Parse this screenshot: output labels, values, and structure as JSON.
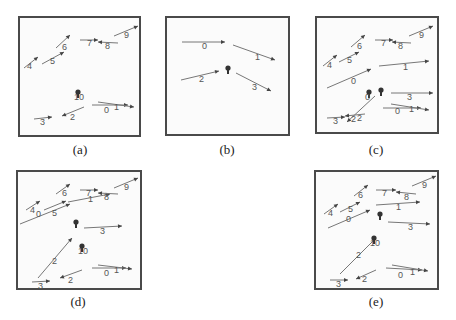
{
  "colors": {
    "border": "#4a4a4a",
    "arrow": "#777777",
    "arrowhead": "#444444",
    "label": "#555555",
    "marker": "#333333"
  },
  "panels": [
    {
      "id": "a",
      "caption": "(a)",
      "box": [
        18,
        16,
        123,
        121
      ],
      "caption_pos": [
        60,
        142
      ],
      "arrows": [
        {
          "label": "4",
          "x1": 4,
          "y1": 50,
          "x2": 18,
          "y2": 39,
          "lx": 7,
          "ly": 51
        },
        {
          "label": "5",
          "x1": 22,
          "y1": 46,
          "x2": 44,
          "y2": 34,
          "lx": 30,
          "ly": 46
        },
        {
          "label": "6",
          "x1": 36,
          "y1": 30,
          "x2": 50,
          "y2": 17,
          "lx": 42,
          "ly": 32
        },
        {
          "label": "7",
          "x1": 60,
          "y1": 22,
          "x2": 78,
          "y2": 22,
          "lx": 67,
          "ly": 28
        },
        {
          "label": "8",
          "x1": 98,
          "y1": 25,
          "x2": 78,
          "y2": 24,
          "lx": 85,
          "ly": 31
        },
        {
          "label": "9",
          "x1": 94,
          "y1": 18,
          "x2": 118,
          "y2": 8,
          "lx": 104,
          "ly": 20
        },
        {
          "label": "0",
          "x1": 72,
          "y1": 87,
          "x2": 108,
          "y2": 87,
          "lx": 84,
          "ly": 95
        },
        {
          "label": "1",
          "x1": 78,
          "y1": 84,
          "x2": 114,
          "y2": 89,
          "lx": 94,
          "ly": 92
        },
        {
          "label": "2",
          "x1": 64,
          "y1": 89,
          "x2": 42,
          "y2": 98,
          "lx": 50,
          "ly": 102
        },
        {
          "label": "3",
          "x1": 14,
          "y1": 101,
          "x2": 32,
          "y2": 99,
          "lx": 20,
          "ly": 107
        }
      ],
      "markers": [
        {
          "label": "10",
          "x": 58,
          "y": 76
        }
      ]
    },
    {
      "id": "b",
      "caption": "(b)",
      "box": [
        165,
        16,
        125,
        120
      ],
      "caption_pos": [
        207,
        142
      ],
      "arrows": [
        {
          "label": "0",
          "x1": 15,
          "y1": 24,
          "x2": 58,
          "y2": 24,
          "lx": 35,
          "ly": 31
        },
        {
          "label": "1",
          "x1": 66,
          "y1": 27,
          "x2": 108,
          "y2": 42,
          "lx": 88,
          "ly": 42
        },
        {
          "label": "2",
          "x1": 14,
          "y1": 62,
          "x2": 52,
          "y2": 53,
          "lx": 32,
          "ly": 64
        },
        {
          "label": "3",
          "x1": 69,
          "y1": 55,
          "x2": 104,
          "y2": 73,
          "lx": 85,
          "ly": 72
        }
      ],
      "markers": [
        {
          "label": "",
          "x": 61,
          "y": 52
        }
      ]
    },
    {
      "id": "c",
      "caption": "(c)",
      "box": [
        315,
        16,
        124,
        118
      ],
      "caption_pos": [
        356,
        142
      ],
      "arrows": [
        {
          "label": "4",
          "x1": 6,
          "y1": 48,
          "x2": 20,
          "y2": 37,
          "lx": 10,
          "ly": 50
        },
        {
          "label": "5",
          "x1": 22,
          "y1": 44,
          "x2": 42,
          "y2": 34,
          "lx": 30,
          "ly": 45
        },
        {
          "label": "6",
          "x1": 34,
          "y1": 29,
          "x2": 48,
          "y2": 17,
          "lx": 40,
          "ly": 31
        },
        {
          "label": "7",
          "x1": 58,
          "y1": 22,
          "x2": 76,
          "y2": 22,
          "lx": 64,
          "ly": 28
        },
        {
          "label": "8",
          "x1": 94,
          "y1": 25,
          "x2": 75,
          "y2": 24,
          "lx": 81,
          "ly": 31
        },
        {
          "label": "9",
          "x1": 92,
          "y1": 18,
          "x2": 116,
          "y2": 8,
          "lx": 102,
          "ly": 20
        },
        {
          "label": "0",
          "x1": 10,
          "y1": 70,
          "x2": 54,
          "y2": 51,
          "lx": 34,
          "ly": 66
        },
        {
          "label": "1",
          "x1": 62,
          "y1": 48,
          "x2": 112,
          "y2": 43,
          "lx": 86,
          "ly": 52
        },
        {
          "label": "3",
          "x1": 74,
          "y1": 75,
          "x2": 116,
          "y2": 75,
          "lx": 90,
          "ly": 82
        },
        {
          "label": "0",
          "x1": 66,
          "y1": 90,
          "x2": 104,
          "y2": 90,
          "lx": 78,
          "ly": 96
        },
        {
          "label": "1",
          "x1": 74,
          "y1": 86,
          "x2": 112,
          "y2": 92,
          "lx": 92,
          "ly": 94
        },
        {
          "label": "2",
          "x1": 58,
          "y1": 78,
          "x2": 30,
          "y2": 104,
          "lx": 40,
          "ly": 103
        },
        {
          "label": "2",
          "x1": 48,
          "y1": 96,
          "x2": 28,
          "y2": 98,
          "lx": 34,
          "ly": 104
        },
        {
          "label": "3",
          "x1": 10,
          "y1": 100,
          "x2": 28,
          "y2": 99,
          "lx": 16,
          "ly": 106
        }
      ],
      "markers": [
        {
          "label": "0",
          "x": 52,
          "y": 76
        },
        {
          "label": "",
          "x": 64,
          "y": 74
        }
      ]
    },
    {
      "id": "d",
      "caption": "(d)",
      "box": [
        16,
        170,
        126,
        120
      ],
      "caption_pos": [
        58,
        294
      ],
      "arrows": [
        {
          "label": "4",
          "x1": 8,
          "y1": 38,
          "x2": 22,
          "y2": 29,
          "lx": 12,
          "ly": 41
        },
        {
          "label": "0",
          "x1": 2,
          "y1": 52,
          "x2": 52,
          "y2": 32,
          "lx": 18,
          "ly": 45
        },
        {
          "label": "5",
          "x1": 26,
          "y1": 38,
          "x2": 48,
          "y2": 29,
          "lx": 34,
          "ly": 44
        },
        {
          "label": "6",
          "x1": 38,
          "y1": 22,
          "x2": 52,
          "y2": 12,
          "lx": 44,
          "ly": 24
        },
        {
          "label": "1",
          "x1": 50,
          "y1": 30,
          "x2": 92,
          "y2": 22,
          "lx": 70,
          "ly": 30
        },
        {
          "label": "7",
          "x1": 62,
          "y1": 18,
          "x2": 80,
          "y2": 18,
          "lx": 68,
          "ly": 24
        },
        {
          "label": "8",
          "x1": 100,
          "y1": 22,
          "x2": 80,
          "y2": 21,
          "lx": 86,
          "ly": 28
        },
        {
          "label": "9",
          "x1": 96,
          "y1": 16,
          "x2": 120,
          "y2": 6,
          "lx": 106,
          "ly": 18
        },
        {
          "label": "3",
          "x1": 66,
          "y1": 56,
          "x2": 104,
          "y2": 54,
          "lx": 82,
          "ly": 62
        },
        {
          "label": "2",
          "x1": 20,
          "y1": 106,
          "x2": 54,
          "y2": 66,
          "lx": 34,
          "ly": 92
        },
        {
          "label": "0",
          "x1": 74,
          "y1": 96,
          "x2": 108,
          "y2": 96,
          "lx": 86,
          "ly": 104
        },
        {
          "label": "1",
          "x1": 80,
          "y1": 93,
          "x2": 114,
          "y2": 97,
          "lx": 96,
          "ly": 101
        },
        {
          "label": "2",
          "x1": 64,
          "y1": 98,
          "x2": 42,
          "y2": 106,
          "lx": 50,
          "ly": 111
        },
        {
          "label": "3",
          "x1": 14,
          "y1": 110,
          "x2": 32,
          "y2": 109,
          "lx": 20,
          "ly": 117
        }
      ],
      "markers": [
        {
          "label": "",
          "x": 58,
          "y": 52
        },
        {
          "label": "10",
          "x": 64,
          "y": 76
        }
      ]
    },
    {
      "id": "e",
      "caption": "(e)",
      "box": [
        314,
        170,
        125,
        120
      ],
      "caption_pos": [
        356,
        294
      ],
      "arrows": [
        {
          "label": "4",
          "x1": 8,
          "y1": 42,
          "x2": 22,
          "y2": 32,
          "lx": 12,
          "ly": 44
        },
        {
          "label": "5",
          "x1": 24,
          "y1": 40,
          "x2": 44,
          "y2": 30,
          "lx": 32,
          "ly": 40
        },
        {
          "label": "0",
          "x1": 12,
          "y1": 56,
          "x2": 54,
          "y2": 38,
          "lx": 30,
          "ly": 50
        },
        {
          "label": "6",
          "x1": 38,
          "y1": 24,
          "x2": 52,
          "y2": 13,
          "lx": 42,
          "ly": 26
        },
        {
          "label": "7",
          "x1": 60,
          "y1": 18,
          "x2": 80,
          "y2": 18,
          "lx": 66,
          "ly": 24
        },
        {
          "label": "8",
          "x1": 100,
          "y1": 22,
          "x2": 80,
          "y2": 20,
          "lx": 88,
          "ly": 28
        },
        {
          "label": "1",
          "x1": 60,
          "y1": 33,
          "x2": 104,
          "y2": 30,
          "lx": 80,
          "ly": 38
        },
        {
          "label": "9",
          "x1": 96,
          "y1": 14,
          "x2": 120,
          "y2": 4,
          "lx": 106,
          "ly": 16
        },
        {
          "label": "3",
          "x1": 72,
          "y1": 50,
          "x2": 114,
          "y2": 52,
          "lx": 92,
          "ly": 58
        },
        {
          "label": "2",
          "x1": 24,
          "y1": 102,
          "x2": 60,
          "y2": 66,
          "lx": 40,
          "ly": 86
        },
        {
          "label": "0",
          "x1": 70,
          "y1": 96,
          "x2": 106,
          "y2": 98,
          "lx": 82,
          "ly": 106
        },
        {
          "label": "1",
          "x1": 76,
          "y1": 93,
          "x2": 112,
          "y2": 99,
          "lx": 94,
          "ly": 103
        },
        {
          "label": "2",
          "x1": 60,
          "y1": 98,
          "x2": 40,
          "y2": 107,
          "lx": 46,
          "ly": 110
        },
        {
          "label": "3",
          "x1": 14,
          "y1": 108,
          "x2": 32,
          "y2": 108,
          "lx": 20,
          "ly": 115
        }
      ],
      "markers": [
        {
          "label": "",
          "x": 64,
          "y": 44
        },
        {
          "label": "10",
          "x": 58,
          "y": 68
        }
      ]
    }
  ]
}
